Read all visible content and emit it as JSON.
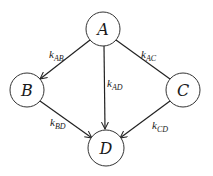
{
  "diagram": {
    "type": "directed-graph",
    "colors": {
      "stroke": "#222222",
      "background": "#ffffff"
    },
    "nodes": [
      {
        "id": "A",
        "label": "A",
        "cx": 103,
        "cy": 29,
        "r": 17
      },
      {
        "id": "B",
        "label": "B",
        "cx": 27,
        "cy": 90,
        "r": 17
      },
      {
        "id": "C",
        "label": "C",
        "cx": 183,
        "cy": 90,
        "r": 17
      },
      {
        "id": "D",
        "label": "D",
        "cx": 106,
        "cy": 148,
        "r": 18
      }
    ],
    "edges": [
      {
        "from": "A",
        "to": "B",
        "label": "k",
        "sub": "AB",
        "arrow": true
      },
      {
        "from": "A",
        "to": "C",
        "label": "k",
        "sub": "AC",
        "arrow": false
      },
      {
        "from": "A",
        "to": "D",
        "label": "k",
        "sub": "AD",
        "arrow": true
      },
      {
        "from": "B",
        "to": "D",
        "label": "k",
        "sub": "BD",
        "arrow": true
      },
      {
        "from": "C",
        "to": "D",
        "label": "k",
        "sub": "CD",
        "arrow": true
      }
    ]
  }
}
